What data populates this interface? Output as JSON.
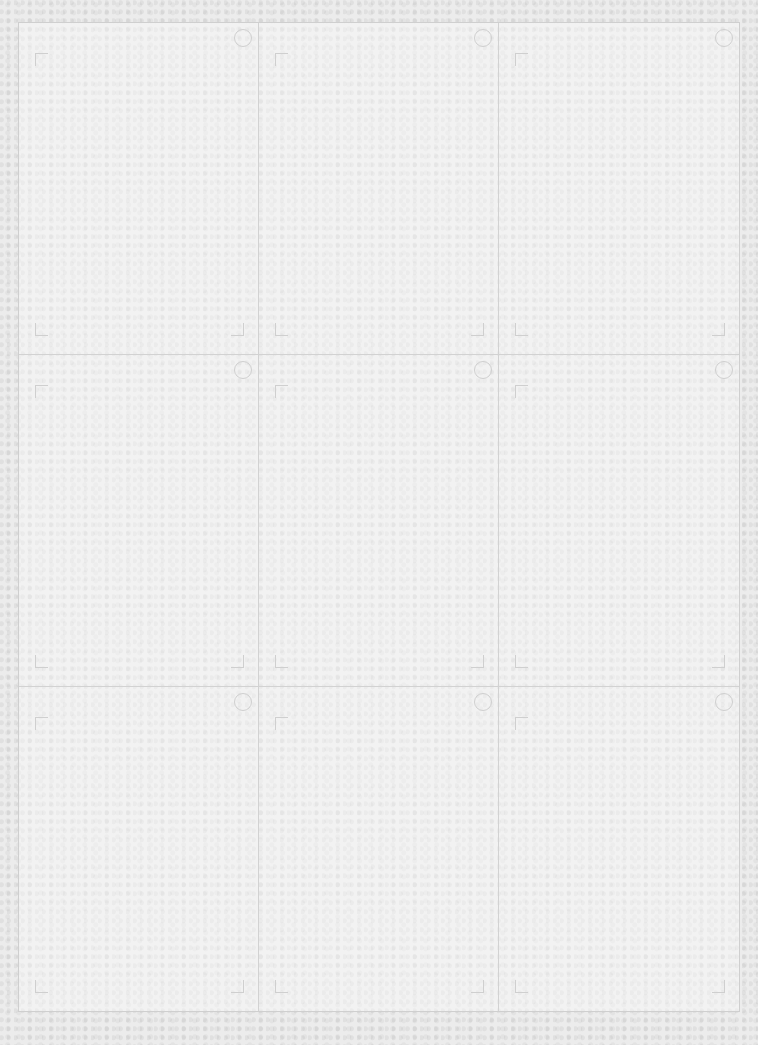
{
  "sheet": {
    "rows": 3,
    "columns": 3,
    "cells": [
      {
        "id": 1,
        "icon": "circle-icon"
      },
      {
        "id": 2,
        "icon": "circle-icon"
      },
      {
        "id": 3,
        "icon": "circle-icon"
      },
      {
        "id": 4,
        "icon": "circle-icon"
      },
      {
        "id": 5,
        "icon": "circle-icon"
      },
      {
        "id": 6,
        "icon": "circle-icon"
      },
      {
        "id": 7,
        "icon": "circle-icon"
      },
      {
        "id": 8,
        "icon": "circle-icon"
      },
      {
        "id": 9,
        "icon": "circle-icon"
      }
    ],
    "colors": {
      "background": "#ececec",
      "lines": "#cfcfcf"
    }
  }
}
